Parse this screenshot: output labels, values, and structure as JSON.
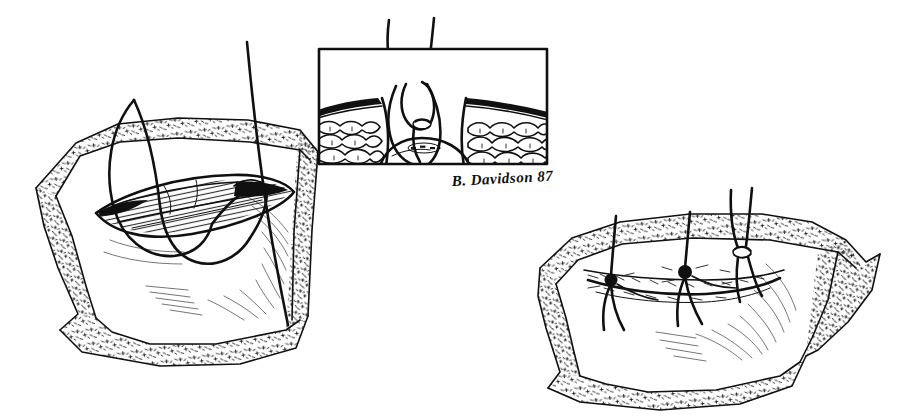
{
  "figure": {
    "medium": "pen-and-ink line drawing",
    "background_color": "#ffffff",
    "ink_color": "#101010",
    "width": 897,
    "height": 417
  },
  "signature": {
    "text": "B. Davidson 87",
    "artist": "B. Davidson",
    "year": "87",
    "x": 452,
    "y": 186
  },
  "panels": [
    {
      "id": "left-panel",
      "name": "open-wound-with-suture-panel",
      "caption": "Open elliptical wound held by surgical drape with a suture strand passed through the wound edges",
      "bounds": {
        "x": 20,
        "y": 30,
        "width": 310,
        "height": 310
      },
      "elements": [
        {
          "name": "surgical-drape",
          "description": "stippled and cross-hatched drape framing the operative field"
        },
        {
          "name": "wound-opening",
          "description": "dark lens-shaped open incision with hatched depth"
        },
        {
          "name": "suture-loop",
          "description": "large looping suture thread entering the wound"
        },
        {
          "name": "suture-strand-long",
          "description": "long straight suture strand running top to bottom"
        }
      ]
    },
    {
      "id": "inset-panel",
      "name": "cross-section-inset-panel",
      "caption": "Boxed cross-sectional detail showing the suture passing through dermis and subcutaneous fat layers",
      "bounds": {
        "x": 318,
        "y": 48,
        "width": 230,
        "height": 117
      },
      "border": true,
      "elements": [
        {
          "name": "dermis-layer",
          "description": "dark dense band at the skin surface on both sides"
        },
        {
          "name": "fat-lobule-layer",
          "description": "rounded lobular subcutaneous fat cells"
        },
        {
          "name": "suture-loop-cross-section",
          "description": "suture loop with visible crossing knot point"
        },
        {
          "name": "deep-tissue-dome",
          "description": "curved fascia / deep tissue dome at the base"
        },
        {
          "name": "suture-tails-exiting",
          "description": "two suture strands exiting the top of the box"
        }
      ]
    },
    {
      "id": "right-panel",
      "name": "closed-wound-with-knots-panel",
      "caption": "Same wound after placement of three interrupted sutures; two are tied with knots and the third is still untied",
      "bounds": {
        "x": 520,
        "y": 190,
        "width": 360,
        "height": 200
      },
      "elements": [
        {
          "name": "surgical-drape",
          "description": "stippled and cross-hatched drape framing the operative field"
        },
        {
          "name": "approximated-wound-line",
          "description": "closed incision line with tissue approximated"
        },
        {
          "name": "suture-knot-1",
          "description": "tied knot with two trailing tails, leftmost"
        },
        {
          "name": "suture-knot-2",
          "description": "tied knot with two trailing tails, center"
        },
        {
          "name": "suture-knot-3",
          "description": "loosely tied knot with long untied strands, rightmost"
        }
      ],
      "knot_count": 3
    }
  ]
}
